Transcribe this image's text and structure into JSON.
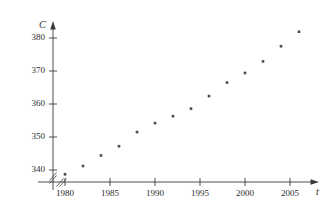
{
  "chart_data": {
    "type": "scatter",
    "title": "",
    "subtitle": "",
    "xlabel": "t",
    "ylabel": "C",
    "xlim": [
      1978.5,
      2007.5
    ],
    "ylim": [
      336.0,
      383.5
    ],
    "grid": false,
    "legend": null,
    "axis_break_x": true,
    "axis_break_y": true,
    "x_ticks": [
      {
        "value": 1980,
        "label": "1980"
      },
      {
        "value": 1985,
        "label": "1985"
      },
      {
        "value": 1990,
        "label": "1990"
      },
      {
        "value": 1995,
        "label": "1995"
      },
      {
        "value": 2000,
        "label": "2000"
      },
      {
        "value": 2005,
        "label": "2005"
      }
    ],
    "y_ticks": [
      {
        "value": 340,
        "label": "340"
      },
      {
        "value": 350,
        "label": "350"
      },
      {
        "value": 360,
        "label": "360"
      },
      {
        "value": 370,
        "label": "370"
      },
      {
        "value": 380,
        "label": "380"
      }
    ],
    "series": [
      {
        "name": "CO2 concentration",
        "x": [
          1980,
          1982,
          1984,
          1986,
          1988,
          1990,
          1992,
          1994,
          1996,
          1998,
          2000,
          2002,
          2004,
          2006
        ],
        "y": [
          338.7,
          341.2,
          344.4,
          347.2,
          351.5,
          354.2,
          356.3,
          358.6,
          362.4,
          366.5,
          369.4,
          372.9,
          377.5,
          381.9
        ],
        "marker": "square",
        "color": "#4a4a52"
      }
    ]
  },
  "axes": {
    "y_axis_name": "C",
    "x_axis_name": "t"
  }
}
